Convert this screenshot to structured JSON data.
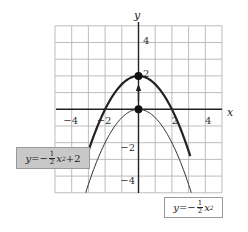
{
  "chart_data": {
    "type": "line",
    "title": "",
    "xlabel": "x",
    "ylabel": "y",
    "xlim": [
      -5,
      5
    ],
    "ylim": [
      -5,
      5
    ],
    "grid": true,
    "x_ticks": [
      -4,
      -2,
      2,
      4
    ],
    "y_ticks": [
      4,
      2,
      -2,
      -4
    ],
    "x_tick_labels": [
      "−4",
      "−2",
      "2",
      "4"
    ],
    "y_tick_labels": [
      "4",
      "2",
      "−2",
      "−4"
    ],
    "series": [
      {
        "name": "y=−½x²+2",
        "style": "thick",
        "x": [
          -3.1,
          -3,
          -2.5,
          -2,
          -1.5,
          -1,
          -0.5,
          0,
          0.5,
          1,
          1.5,
          2,
          2.5,
          3,
          3.1
        ],
        "y": [
          -2.805,
          -2.5,
          -1.125,
          0,
          0.875,
          1.5,
          1.875,
          2,
          1.875,
          1.5,
          0.875,
          0,
          -1.125,
          -2.5,
          -2.805
        ]
      },
      {
        "name": "y=−½x²",
        "style": "thin",
        "x": [
          -3.16,
          -3,
          -2.5,
          -2,
          -1.5,
          -1,
          -0.5,
          0,
          0.5,
          1,
          1.5,
          2,
          2.5,
          3,
          3.16
        ],
        "y": [
          -4.99,
          -4.5,
          -3.125,
          -2,
          -1.125,
          -0.5,
          -0.125,
          0,
          -0.125,
          -0.5,
          -1.125,
          -2,
          -3.125,
          -4.5,
          -4.99
        ]
      }
    ],
    "points": [
      {
        "x": 0,
        "y": 2,
        "label": "vertex of y=−½x²+2"
      },
      {
        "x": 0,
        "y": 0,
        "label": "vertex of y=−½x²"
      }
    ],
    "annotations": [
      {
        "type": "arrow",
        "from": [
          0,
          0.5
        ],
        "to": [
          0,
          1.4
        ],
        "meaning": "vertical shift up 2"
      }
    ],
    "legend": [
      {
        "text": "y=−½x²+2",
        "position": "lower-left",
        "box_fill": "#c8c8c8"
      },
      {
        "text": "y=−½x²",
        "position": "bottom-right",
        "box_fill": "#ffffff"
      }
    ]
  },
  "labels": {
    "upper": {
      "prefix": "y=−",
      "num": "1",
      "den": "2",
      "var": "x",
      "exp": "2",
      "suffix": "+2"
    },
    "lower": {
      "prefix": "y=−",
      "num": "1",
      "den": "2",
      "var": "x",
      "exp": "2",
      "suffix": ""
    }
  },
  "colors": {
    "grid": "#b5b5b5",
    "axis": "#222222",
    "curve": "#222222",
    "upper_box_fill": "#c8c8c8",
    "upper_box_border": "#9a9a9a",
    "lower_box_fill": "#ffffff",
    "lower_box_border": "#9a9a9a"
  }
}
